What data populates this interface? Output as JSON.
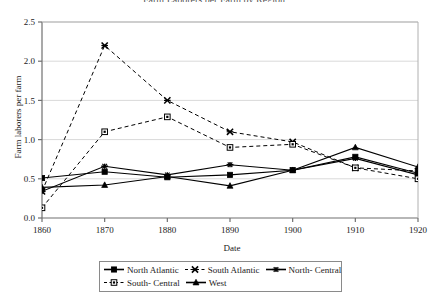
{
  "chart_data": {
    "type": "line",
    "title": "Farm Laborers per Farm by Region",
    "xlabel": "Date",
    "ylabel": "Farm laborers per farm",
    "x": [
      1860,
      1870,
      1880,
      1890,
      1900,
      1910,
      1920
    ],
    "xticklabels": [
      "1860",
      "1870",
      "1880",
      "1890",
      "1900",
      "1910",
      "1920"
    ],
    "yticklabels": [
      "0.0",
      "0.5",
      "1.0",
      "1.5",
      "2.0",
      "2.5"
    ],
    "yticks": [
      0.0,
      0.5,
      1.0,
      1.5,
      2.0,
      2.5
    ],
    "xlim": [
      1860,
      1920
    ],
    "ylim": [
      0.0,
      2.5
    ],
    "grid": "horizontal",
    "legend_position": "bottom",
    "series": [
      {
        "name": "North Atlantic",
        "marker": "filled-square",
        "line": "solid",
        "color": "#000000",
        "values": [
          0.51,
          0.59,
          0.52,
          0.55,
          0.61,
          0.78,
          0.57
        ]
      },
      {
        "name": "South Atlantic",
        "marker": "x-cross",
        "line": "dashed",
        "color": "#000000",
        "values": [
          0.34,
          2.2,
          1.5,
          1.1,
          0.97,
          0.64,
          0.6
        ]
      },
      {
        "name": "North- Central",
        "marker": "star-burst",
        "line": "solid",
        "color": "#000000",
        "values": [
          0.34,
          0.66,
          0.55,
          0.68,
          0.61,
          0.76,
          0.55
        ]
      },
      {
        "name": "South- Central",
        "marker": "open-square",
        "line": "dashed",
        "color": "#000000",
        "values": [
          0.13,
          1.1,
          1.29,
          0.9,
          0.94,
          0.64,
          0.5
        ]
      },
      {
        "name": "West",
        "marker": "filled-triangle",
        "line": "solid",
        "color": "#000000",
        "values": [
          0.39,
          0.42,
          0.53,
          0.41,
          0.61,
          0.9,
          0.65
        ]
      }
    ]
  }
}
